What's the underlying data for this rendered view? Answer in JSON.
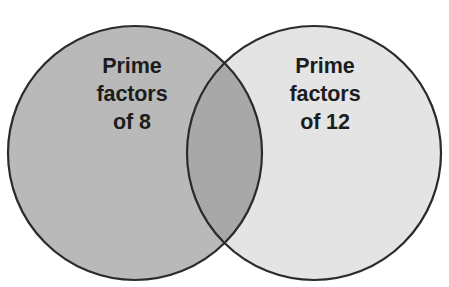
{
  "diagram": {
    "type": "venn-diagram",
    "canvas": {
      "width": 449,
      "height": 287,
      "background_color": "#ffffff"
    },
    "stroke": {
      "color": "#2b2b2b",
      "width": 2.2
    },
    "sets": [
      {
        "id": "left",
        "name": "prime-factors-of-8",
        "fill_color": "#b9b9b9",
        "center_x": 135,
        "center_y": 153,
        "radius": 127,
        "label_lines": [
          "Prime",
          "factors",
          "of 8"
        ]
      },
      {
        "id": "right",
        "name": "prime-factors-of-12",
        "fill_color": "#e4e4e4",
        "center_x": 314,
        "center_y": 153,
        "radius": 127,
        "label_lines": [
          "Prime",
          "factors",
          "of 12"
        ]
      }
    ],
    "intersection": {
      "name": "overlap-region",
      "fill_color": "#a8a8a8",
      "top_crossing_x": 224,
      "top_crossing_y": 48,
      "bottom_crossing_x": 224,
      "bottom_crossing_y": 258
    },
    "labels": {
      "left": {
        "line1": "Prime",
        "line2": "factors",
        "line3": "of 8"
      },
      "right": {
        "line1": "Prime",
        "line2": "factors",
        "line3": "of 12"
      }
    }
  }
}
